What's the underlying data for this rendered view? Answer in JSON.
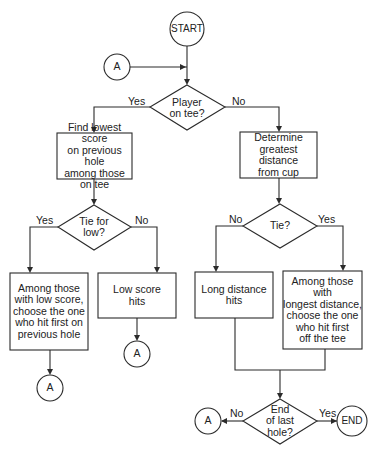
{
  "diagram": {
    "type": "flowchart",
    "nodes": {
      "start": {
        "shape": "circle",
        "text": "START"
      },
      "connector_top": {
        "shape": "circle",
        "text": "A"
      },
      "player_on_tee": {
        "shape": "diamond",
        "text": "Player\non tee?"
      },
      "find_lowest": {
        "shape": "box",
        "text": "Find lowest score\non previous hole\namong those\non tee"
      },
      "determine_distance": {
        "shape": "box",
        "text": "Determine\ngreatest\ndistance\nfrom cup"
      },
      "tie_for_low": {
        "shape": "diamond",
        "text": "Tie for\nlow?"
      },
      "tie": {
        "shape": "diamond",
        "text": "Tie?"
      },
      "among_low_score": {
        "shape": "box",
        "text": "Among those\nwith low score,\nchoose the one\nwho hit first on\nprevious hole"
      },
      "low_score_hits": {
        "shape": "box",
        "text": "Low score\nhits"
      },
      "long_distance_hits": {
        "shape": "box",
        "text": "Long distance\nhits"
      },
      "among_longest": {
        "shape": "box",
        "text": "Among those with\nlongest distance,\nchoose the one\nwho hit first\noff the tee"
      },
      "connector_left": {
        "shape": "circle",
        "text": "A"
      },
      "connector_mid": {
        "shape": "circle",
        "text": "A"
      },
      "end_of_last_hole": {
        "shape": "diamond",
        "text": "End\nof last\nhole?"
      },
      "connector_bottom": {
        "shape": "circle",
        "text": "A"
      },
      "end": {
        "shape": "circle",
        "text": "END"
      }
    },
    "edge_labels": {
      "player_yes": "Yes",
      "player_no": "No",
      "tielow_yes": "Yes",
      "tielow_no": "No",
      "tie_no": "No",
      "tie_yes": "Yes",
      "end_no": "No",
      "end_yes": "Yes"
    },
    "edges": [
      {
        "from": "start",
        "to": "player_on_tee"
      },
      {
        "from": "connector_top",
        "to": "player_on_tee"
      },
      {
        "from": "player_on_tee",
        "to": "find_lowest",
        "label": "Yes"
      },
      {
        "from": "player_on_tee",
        "to": "determine_distance",
        "label": "No"
      },
      {
        "from": "find_lowest",
        "to": "tie_for_low"
      },
      {
        "from": "tie_for_low",
        "to": "among_low_score",
        "label": "Yes"
      },
      {
        "from": "tie_for_low",
        "to": "low_score_hits",
        "label": "No"
      },
      {
        "from": "among_low_score",
        "to": "connector_left"
      },
      {
        "from": "low_score_hits",
        "to": "connector_mid"
      },
      {
        "from": "determine_distance",
        "to": "tie"
      },
      {
        "from": "tie",
        "to": "long_distance_hits",
        "label": "No"
      },
      {
        "from": "tie",
        "to": "among_longest",
        "label": "Yes"
      },
      {
        "from": "long_distance_hits",
        "to": "end_of_last_hole"
      },
      {
        "from": "among_longest",
        "to": "end_of_last_hole"
      },
      {
        "from": "end_of_last_hole",
        "to": "connector_bottom",
        "label": "No"
      },
      {
        "from": "end_of_last_hole",
        "to": "end",
        "label": "Yes"
      }
    ]
  }
}
